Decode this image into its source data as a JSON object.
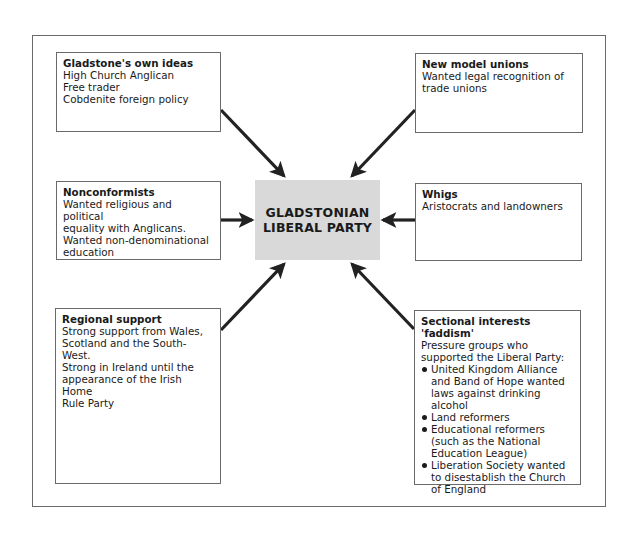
{
  "center": {
    "line1": "GLADSTONIAN",
    "line2": "LIBERAL PARTY",
    "fill_color": "#d9d9d9"
  },
  "boxes": {
    "gladstone": {
      "title": "Gladstone's own ideas",
      "lines": [
        "High Church Anglican",
        "Free trader",
        "Cobdenite foreign policy"
      ]
    },
    "nonconformists": {
      "title": "Nonconformists",
      "lines": [
        "Wanted religious and political",
        "equality with Anglicans.",
        "Wanted non-denominational",
        "education"
      ]
    },
    "regional": {
      "title": "Regional support",
      "lines": [
        "Strong support from Wales,",
        "Scotland and the South-West.",
        "Strong in Ireland until the",
        "appearance of the Irish Home",
        "Rule Party"
      ]
    },
    "unions": {
      "title": "New model unions",
      "lines": [
        "Wanted legal recognition of",
        "trade unions"
      ]
    },
    "whigs": {
      "title": "Whigs",
      "lines": [
        "Aristocrats and landowners"
      ]
    },
    "sectional": {
      "title_line1": "Sectional interests",
      "title_line2": "'faddism'",
      "lines": [
        "Pressure groups who",
        "supported the Liberal Party:"
      ],
      "bullets": [
        "United Kingdom Alliance and Band of Hope wanted laws against drinking alcohol",
        "Land reformers",
        "Educational reformers (such as the National Education League)",
        "Liberation Society wanted to disestablish the Church of England"
      ]
    }
  },
  "arrows": [
    {
      "from": "gladstone",
      "to": "center"
    },
    {
      "from": "nonconformists",
      "to": "center"
    },
    {
      "from": "regional",
      "to": "center"
    },
    {
      "from": "unions",
      "to": "center"
    },
    {
      "from": "whigs",
      "to": "center"
    },
    {
      "from": "sectional",
      "to": "center"
    }
  ]
}
